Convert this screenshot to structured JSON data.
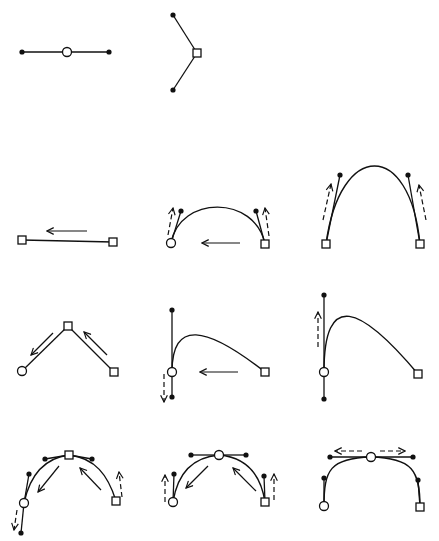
{
  "colors": {
    "ink": "#111111",
    "background": "#ffffff"
  },
  "legend": {
    "smooth_node": "hollow circle",
    "corner_node": "hollow square",
    "control_handle": "filled dot",
    "drag_direction": "solid arrow",
    "handle_motion": "dashed arrow"
  },
  "panels": [
    {
      "id": "smooth-node-example",
      "lines": [
        [
          22,
          52,
          109,
          52
        ]
      ],
      "curves": [],
      "dots": [
        [
          22,
          52
        ],
        [
          109,
          52
        ]
      ],
      "circles": [
        [
          67,
          52
        ]
      ],
      "squares": [],
      "arrows": [],
      "dashed_arrows": []
    },
    {
      "id": "corner-node-example",
      "lines": [
        [
          173,
          15,
          197,
          53
        ],
        [
          197,
          53,
          173,
          90
        ]
      ],
      "curves": [],
      "dots": [
        [
          173,
          15
        ],
        [
          173,
          90
        ]
      ],
      "circles": [],
      "squares": [
        [
          197,
          53
        ]
      ],
      "arrows": [],
      "dashed_arrows": []
    },
    {
      "id": "row1-straight-segment",
      "lines": [
        [
          22,
          240,
          113,
          242
        ]
      ],
      "curves": [],
      "dots": [],
      "circles": [],
      "squares": [
        [
          22,
          240
        ],
        [
          113,
          242
        ]
      ],
      "arrows": [
        [
          87,
          231,
          47,
          231
        ]
      ],
      "dashed_arrows": []
    },
    {
      "id": "row1-shallow-arc",
      "lines": [
        [
          171,
          243,
          181,
          211
        ],
        [
          265,
          244,
          256,
          211
        ]
      ],
      "curves": [
        "M171,243 C180,195 255,195 265,244"
      ],
      "dots": [
        [
          181,
          211
        ],
        [
          256,
          211
        ]
      ],
      "circles": [
        [
          171,
          243
        ]
      ],
      "squares": [
        [
          265,
          244
        ]
      ],
      "arrows": [
        [
          240,
          243,
          202,
          243
        ]
      ],
      "dashed_arrows": [
        [
          168,
          235,
          173,
          208
        ],
        [
          269,
          236,
          265,
          208
        ]
      ]
    },
    {
      "id": "row1-tall-arc",
      "lines": [
        [
          326,
          244,
          340,
          175
        ],
        [
          420,
          244,
          408,
          175
        ]
      ],
      "curves": [
        "M326,244 C340,140 410,140 420,244"
      ],
      "dots": [
        [
          340,
          175
        ],
        [
          408,
          175
        ]
      ],
      "circles": [],
      "squares": [
        [
          326,
          244
        ],
        [
          420,
          244
        ]
      ],
      "arrows": [],
      "dashed_arrows": [
        [
          323,
          220,
          331,
          184
        ],
        [
          426,
          220,
          419,
          185
        ]
      ]
    },
    {
      "id": "row2-corner-peak",
      "lines": [
        [
          22,
          371,
          68,
          326
        ],
        [
          68,
          326,
          114,
          372
        ]
      ],
      "curves": [],
      "dots": [],
      "circles": [
        [
          22,
          371
        ]
      ],
      "squares": [
        [
          68,
          326
        ],
        [
          114,
          372
        ]
      ],
      "arrows": [
        [
          53,
          333,
          31,
          355
        ],
        [
          107,
          355,
          84,
          332
        ]
      ],
      "dashed_arrows": []
    },
    {
      "id": "row2-asym-curve",
      "lines": [
        [
          172,
          310,
          172,
          372
        ],
        [
          172,
          372,
          172,
          397
        ]
      ],
      "curves": [
        "M172,372 C172,320 205,325 265,372"
      ],
      "dots": [
        [
          172,
          310
        ],
        [
          172,
          397
        ]
      ],
      "circles": [
        [
          172,
          372
        ]
      ],
      "squares": [
        [
          265,
          372
        ]
      ],
      "arrows": [
        [
          238,
          372,
          200,
          372
        ]
      ],
      "dashed_arrows": [
        [
          164,
          374,
          164,
          402
        ]
      ]
    },
    {
      "id": "row2-asym-curve-result",
      "lines": [
        [
          324,
          295,
          324,
          372
        ],
        [
          324,
          372,
          324,
          399
        ]
      ],
      "curves": [
        "M324,372 C324,290 360,305 418,374"
      ],
      "dots": [
        [
          324,
          295
        ],
        [
          324,
          399
        ]
      ],
      "circles": [
        [
          324,
          372
        ]
      ],
      "squares": [
        [
          418,
          374
        ]
      ],
      "arrows": [],
      "dashed_arrows": [
        [
          318,
          347,
          318,
          312
        ]
      ]
    },
    {
      "id": "row3-corner-top",
      "lines": [
        [
          45,
          459,
          69,
          455
        ],
        [
          69,
          455,
          92,
          459
        ],
        [
          29,
          474,
          24,
          503
        ],
        [
          24,
          503,
          21,
          533
        ]
      ],
      "curves": [
        "M24,503 C30,475 45,458 69,455",
        "M69,455 C95,458 108,475 116,501"
      ],
      "dots": [
        [
          45,
          459
        ],
        [
          92,
          459
        ],
        [
          29,
          474
        ],
        [
          21,
          533
        ]
      ],
      "circles": [
        [
          24,
          503
        ]
      ],
      "squares": [
        [
          69,
          455
        ],
        [
          116,
          501
        ]
      ],
      "arrows": [
        [
          59,
          466,
          38,
          492
        ],
        [
          101,
          490,
          80,
          468
        ]
      ],
      "dashed_arrows": [
        [
          17,
          510,
          14,
          530
        ],
        [
          122,
          497,
          119,
          472
        ]
      ]
    },
    {
      "id": "row3-smooth-top",
      "lines": [
        [
          191,
          455,
          219,
          455
        ],
        [
          219,
          455,
          246,
          455
        ],
        [
          173,
          502,
          174,
          474
        ],
        [
          265,
          502,
          264,
          476
        ]
      ],
      "curves": [
        "M173,502 C178,470 195,457 219,455",
        "M219,455 C243,457 260,470 265,502"
      ],
      "dots": [
        [
          191,
          455
        ],
        [
          246,
          455
        ],
        [
          174,
          474
        ],
        [
          264,
          476
        ]
      ],
      "circles": [
        [
          219,
          455
        ],
        [
          173,
          502
        ]
      ],
      "squares": [
        [
          265,
          502
        ]
      ],
      "arrows": [
        [
          208,
          466,
          186,
          488
        ],
        [
          256,
          491,
          233,
          468
        ]
      ],
      "dashed_arrows": [
        [
          165,
          502,
          165,
          475
        ],
        [
          274,
          500,
          274,
          474
        ]
      ]
    },
    {
      "id": "row3-smooth-top-extended",
      "lines": [
        [
          330,
          457,
          371,
          457
        ],
        [
          371,
          457,
          413,
          457
        ],
        [
          324,
          506,
          324,
          478
        ],
        [
          420,
          507,
          418,
          480
        ]
      ],
      "curves": [
        "M324,506 C324,470 330,458 371,457",
        "M371,457 C412,458 420,470 420,507"
      ],
      "dots": [
        [
          330,
          457
        ],
        [
          413,
          457
        ],
        [
          324,
          478
        ],
        [
          418,
          480
        ]
      ],
      "circles": [
        [
          371,
          457
        ],
        [
          324,
          506
        ]
      ],
      "squares": [
        [
          420,
          507
        ]
      ],
      "arrows": [],
      "dashed_arrows": [
        [
          362,
          451,
          335,
          451
        ],
        [
          380,
          451,
          405,
          451
        ]
      ]
    }
  ]
}
